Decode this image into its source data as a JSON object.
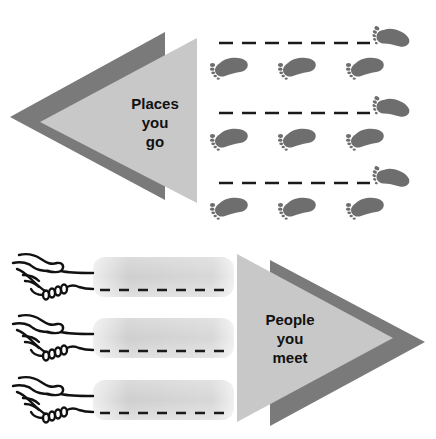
{
  "diagram": {
    "top_section": {
      "label_lines": [
        "Places",
        "you",
        "go"
      ],
      "arrow_direction": "left",
      "icon": "footprint-icon",
      "footprint_rows": 3,
      "footprints_per_row": 3
    },
    "bottom_section": {
      "label_lines": [
        "People",
        "you",
        "meet"
      ],
      "arrow_direction": "right",
      "icon": "handshake-icon",
      "rows": 3
    }
  },
  "colors": {
    "dark_triangle": "#7a7a7a",
    "light_triangle": "#c8c8c8",
    "footprint": "#6e6e6e",
    "dash": "#1a1a1a",
    "pill": "#d4d4d4",
    "handshake_stroke": "#111111"
  }
}
